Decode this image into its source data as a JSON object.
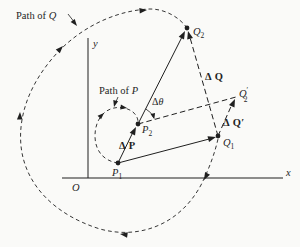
{
  "figure": {
    "colors": {
      "ink": "#1f1f1f",
      "paper": "#fafaf8"
    },
    "labels": {
      "path_q": {
        "prefix": "Path of ",
        "var": "Q"
      },
      "path_p": {
        "prefix": "Path of ",
        "var": "P"
      }
    },
    "axes": {
      "x": "x",
      "y": "y",
      "origin": "O"
    },
    "points": {
      "q2": {
        "base": "Q",
        "sub": "2"
      },
      "q1": {
        "base": "Q",
        "sub": "1"
      },
      "q2p": {
        "base": "Q",
        "prime": "′",
        "sub": "2"
      },
      "p2": {
        "base": "P",
        "sub": "2"
      },
      "p1": {
        "base": "P",
        "sub": "1"
      }
    },
    "vectors": {
      "dq": {
        "label": "Δ Q",
        "prime": ""
      },
      "dqp": {
        "label": "Δ Q",
        "prime": "′"
      },
      "dp": {
        "label": "Δ P",
        "prime": ""
      },
      "dtheta": {
        "delta": "Δ",
        "var": "θ"
      }
    }
  }
}
